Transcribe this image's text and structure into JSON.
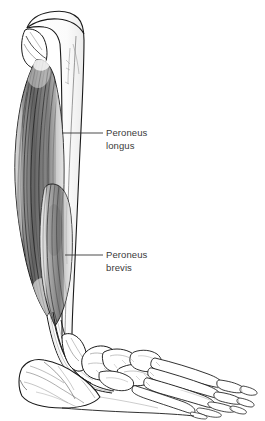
{
  "figure": {
    "background_color": "#ffffff",
    "ink_color": "#1a1a1a",
    "label_color": "#3a3a3a",
    "width": 265,
    "height": 421
  },
  "labels": [
    {
      "id": "peroneus-longus",
      "line1": "Peroneus",
      "line2": "longus",
      "leader_from_x": 62,
      "leader_from_y": 133,
      "leader_to_x": 103,
      "leader_to_y": 133
    },
    {
      "id": "peroneus-brevis",
      "line1": "Peroneus",
      "line2": "brevis",
      "leader_from_x": 65,
      "leader_from_y": 255,
      "leader_to_x": 103,
      "leader_to_y": 255
    }
  ],
  "structures": [
    {
      "name": "tibia",
      "type": "bone"
    },
    {
      "name": "fibula",
      "type": "bone"
    },
    {
      "name": "peroneus-longus-muscle",
      "type": "muscle"
    },
    {
      "name": "peroneus-brevis-muscle",
      "type": "muscle"
    },
    {
      "name": "peroneal-tendons",
      "type": "tendon"
    },
    {
      "name": "lateral-malleolus",
      "type": "bone"
    },
    {
      "name": "calcaneus",
      "type": "bone"
    },
    {
      "name": "talus",
      "type": "bone"
    },
    {
      "name": "navicular",
      "type": "bone"
    },
    {
      "name": "cuboid",
      "type": "bone"
    },
    {
      "name": "cuneiforms",
      "type": "bone"
    },
    {
      "name": "metatarsals",
      "type": "bone"
    },
    {
      "name": "phalanges",
      "type": "bone"
    }
  ]
}
